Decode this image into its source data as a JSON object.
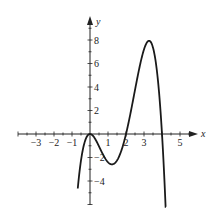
{
  "chart_data": {
    "type": "line",
    "title": "",
    "xlabel": "x",
    "ylabel": "y",
    "xlim": [
      -4,
      6
    ],
    "ylim": [
      -6,
      10
    ],
    "grid": false,
    "x_ticks": [
      -3,
      -2,
      -1,
      1,
      2,
      3,
      5
    ],
    "x_tick_labels": [
      "−3",
      "−2",
      "−1",
      "1",
      "2",
      "3",
      "5"
    ],
    "y_ticks": [
      8,
      6,
      4,
      2,
      -2,
      -4
    ],
    "y_tick_labels": [
      "8",
      "6",
      "4",
      "2",
      "−2",
      "−4"
    ],
    "series": [
      {
        "name": "f(x)",
        "x": [
          -0.7,
          -0.5,
          -0.25,
          0,
          0.5,
          1,
          1.2,
          1.5,
          2,
          2.5,
          3,
          3.3,
          3.6,
          4,
          4.2
        ],
        "values": [
          -5.0,
          -2.25,
          -0.49,
          0,
          -1.05,
          -2.4,
          -2.58,
          -2.25,
          0,
          3.75,
          7.2,
          7.9,
          6.7,
          0,
          -6.0
        ]
      }
    ],
    "features": {
      "double_root": 0,
      "roots": [
        0,
        2,
        4
      ],
      "local_min": [
        1.2,
        -2.6
      ],
      "local_max": [
        3.3,
        8
      ]
    }
  },
  "labels": {
    "x_axis": "x",
    "y_axis": "y"
  }
}
